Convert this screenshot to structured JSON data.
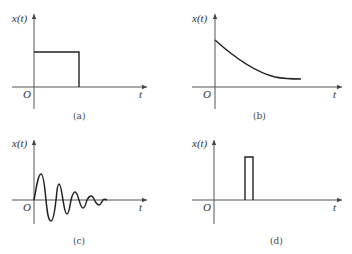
{
  "figure": {
    "panels": [
      {
        "id": "a",
        "caption": "(a)",
        "ylabel": "x(t)",
        "xlabel": "t",
        "origin": "O",
        "shape": "rectangular pulse starting at origin"
      },
      {
        "id": "b",
        "caption": "(b)",
        "ylabel": "x(t)",
        "xlabel": "t",
        "origin": "O",
        "shape": "decaying exponential"
      },
      {
        "id": "c",
        "caption": "(c)",
        "ylabel": "x(t)",
        "xlabel": "t",
        "origin": "O",
        "shape": "damped oscillation"
      },
      {
        "id": "d",
        "caption": "(d)",
        "ylabel": "x(t)",
        "xlabel": "t",
        "origin": "O",
        "shape": "narrow delayed rectangular pulse"
      }
    ]
  },
  "colors": {
    "line": "#222222",
    "axis": "#444444",
    "text": "#333333"
  }
}
